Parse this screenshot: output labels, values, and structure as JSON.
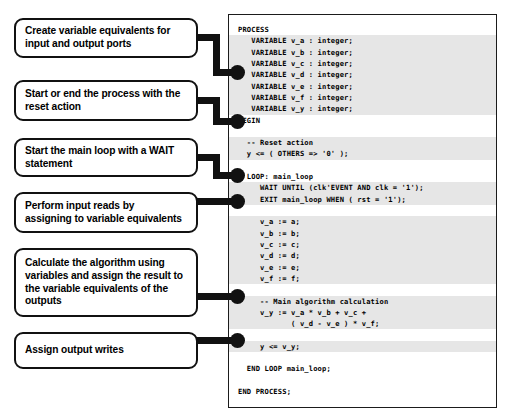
{
  "diagram": {
    "accent_color": "#111111",
    "highlight_color": "#e6e6e6",
    "annotations": [
      {
        "id": "create-variable-equivalents",
        "text": "Create variable equivalents for\ninput and output ports"
      },
      {
        "id": "reset-action",
        "text": "Start or end  the process with the\nreset action"
      },
      {
        "id": "wait-statement",
        "text": "Start the main loop with a WAIT\nstatement"
      },
      {
        "id": "input-reads",
        "text": "Perform input reads  by\nassigning to variable equivalents"
      },
      {
        "id": "calculate-algorithm",
        "text": "Calculate the algorithm using\nvariables and assign the result to\nthe variable equivalents of the\noutputs"
      },
      {
        "id": "output-writes",
        "text": "Assign output writes"
      }
    ]
  },
  "code": {
    "language": "VHDL",
    "lines": [
      {
        "text": "PROCESS",
        "highlight": false
      },
      {
        "text": "   VARIABLE v_a : integer;",
        "highlight": true
      },
      {
        "text": "   VARIABLE v_b : integer;",
        "highlight": true
      },
      {
        "text": "   VARIABLE v_c : integer;",
        "highlight": true
      },
      {
        "text": "   VARIABLE v_d : integer;",
        "highlight": true
      },
      {
        "text": "   VARIABLE v_e : integer;",
        "highlight": true
      },
      {
        "text": "   VARIABLE v_f : integer;",
        "highlight": true
      },
      {
        "text": "   VARIABLE v_y : integer;",
        "highlight": true
      },
      {
        "text": "BEGIN",
        "highlight": false
      },
      {
        "text": "",
        "highlight": false
      },
      {
        "text": "  -- Reset action",
        "highlight": true
      },
      {
        "text": "  y <= ( OTHERS => '0' );",
        "highlight": true
      },
      {
        "text": "",
        "highlight": false
      },
      {
        "text": "  LOOP: main_loop",
        "highlight": false
      },
      {
        "text": "     WAIT UNTIL (clk'EVENT AND clk = '1');",
        "highlight": true
      },
      {
        "text": "     EXIT main_loop WHEN ( rst = '1');",
        "highlight": true
      },
      {
        "text": "",
        "highlight": false
      },
      {
        "text": "     v_a := a;",
        "highlight": true
      },
      {
        "text": "     v_b := b;",
        "highlight": true
      },
      {
        "text": "     v_c := c;",
        "highlight": true
      },
      {
        "text": "     v_d := d;",
        "highlight": true
      },
      {
        "text": "     v_e := e;",
        "highlight": true
      },
      {
        "text": "     v_f := f;",
        "highlight": true
      },
      {
        "text": "",
        "highlight": false
      },
      {
        "text": "     -- Main algorithm calculation",
        "highlight": true
      },
      {
        "text": "     v_y := v_a * v_b + v_c +",
        "highlight": true
      },
      {
        "text": "            ( v_d - v_e ) * v_f;",
        "highlight": true
      },
      {
        "text": "",
        "highlight": false
      },
      {
        "text": "     y <= v_y;",
        "highlight": true
      },
      {
        "text": "",
        "highlight": false
      },
      {
        "text": "  END LOOP main_loop;",
        "highlight": false
      },
      {
        "text": "",
        "highlight": false
      },
      {
        "text": "END PROCESS;",
        "highlight": false
      }
    ]
  }
}
